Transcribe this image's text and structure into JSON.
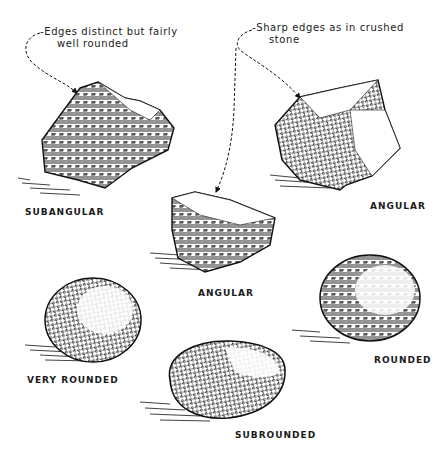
{
  "diagram": {
    "annotations": [
      {
        "id": "subangular-note",
        "line1": "-Edges distinct but fairly",
        "line2": "well rounded",
        "points_to": "SUBANGULAR"
      },
      {
        "id": "angular-note",
        "line1": "-Sharp edges as in crushed",
        "line2": "stone",
        "points_to": "ANGULAR"
      }
    ],
    "specimens": [
      {
        "id": "subangular",
        "label": "SUBANGULAR"
      },
      {
        "id": "angular-top",
        "label": "ANGULAR"
      },
      {
        "id": "angular-middle",
        "label": "ANGULAR"
      },
      {
        "id": "very-rounded",
        "label": "VERY ROUNDED"
      },
      {
        "id": "rounded",
        "label": "ROUNDED"
      },
      {
        "id": "subrounded",
        "label": "SUBROUNDED"
      }
    ],
    "colors": {
      "ink": "#1a1a1a",
      "background": "#ffffff"
    }
  }
}
